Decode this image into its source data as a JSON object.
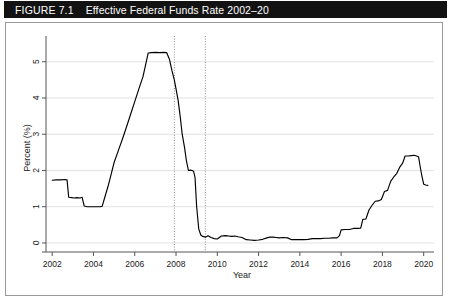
{
  "header": {
    "figure_label": "FIGURE 7.1",
    "title": "Effective Federal Funds Rate 2002–20",
    "bar_color": "#121212",
    "text_color": "#ffffff"
  },
  "chart_data": {
    "type": "line",
    "title": "Effective Federal Funds Rate 2002–20",
    "xlabel": "Year",
    "ylabel": "Percent (%)",
    "xlim": [
      2001.7,
      2020.5
    ],
    "ylim": [
      -0.25,
      5.6
    ],
    "grid": true,
    "legend": null,
    "line_color": "#000000",
    "grid_color": "#e2e2e2",
    "axis_color": "#555555",
    "xticks": [
      2002,
      2004,
      2006,
      2008,
      2010,
      2012,
      2014,
      2016,
      2018,
      2020
    ],
    "xtick_labels": [
      "2002",
      "2004",
      "2006",
      "2008",
      "2010",
      "2012",
      "2014",
      "2016",
      "2018",
      "2020"
    ],
    "yticks": [
      0,
      1,
      2,
      3,
      4,
      5
    ],
    "ytick_labels": [
      "0",
      "1",
      "2",
      "3",
      "4",
      "5"
    ],
    "annotations": [
      {
        "type": "vline",
        "name": "recession-start-marker",
        "x": 2007.92,
        "style": "dotted",
        "color": "#8c8c8c"
      },
      {
        "type": "vline",
        "name": "recession-end-marker",
        "x": 2009.42,
        "style": "dotted",
        "color": "#8c8c8c"
      }
    ],
    "series": [
      {
        "name": "Effective Federal Funds Rate",
        "x": [
          2002.0,
          2002.2,
          2002.4,
          2002.6,
          2002.72,
          2002.8,
          2002.95,
          2003.05,
          2003.2,
          2003.35,
          2003.45,
          2003.55,
          2003.7,
          2003.85,
          2004.0,
          2004.15,
          2004.3,
          2004.42,
          2004.55,
          2004.7,
          2004.85,
          2005.0,
          2005.2,
          2005.4,
          2005.6,
          2005.8,
          2006.0,
          2006.2,
          2006.4,
          2006.52,
          2006.65,
          2006.8,
          2007.0,
          2007.2,
          2007.4,
          2007.55,
          2007.68,
          2007.8,
          2007.92,
          2008.0,
          2008.1,
          2008.2,
          2008.3,
          2008.42,
          2008.5,
          2008.6,
          2008.7,
          2008.78,
          2008.85,
          2008.92,
          2009.0,
          2009.1,
          2009.2,
          2009.3,
          2009.42,
          2009.55,
          2009.7,
          2009.85,
          2010.0,
          2010.2,
          2010.4,
          2010.55,
          2010.7,
          2010.85,
          2011.0,
          2011.2,
          2011.4,
          2011.6,
          2011.8,
          2012.0,
          2012.2,
          2012.4,
          2012.55,
          2012.7,
          2012.85,
          2013.0,
          2013.2,
          2013.4,
          2013.6,
          2013.8,
          2014.0,
          2014.2,
          2014.4,
          2014.6,
          2014.8,
          2015.0,
          2015.2,
          2015.4,
          2015.6,
          2015.8,
          2015.92,
          2016.0,
          2016.2,
          2016.4,
          2016.6,
          2016.8,
          2016.95,
          2017.05,
          2017.2,
          2017.35,
          2017.5,
          2017.65,
          2017.8,
          2017.95,
          2018.1,
          2018.25,
          2018.4,
          2018.55,
          2018.7,
          2018.85,
          2018.98,
          2019.1,
          2019.25,
          2019.4,
          2019.55,
          2019.65,
          2019.75,
          2019.85,
          2019.92,
          2020.0,
          2020.1,
          2020.2
        ],
        "values": [
          1.73,
          1.74,
          1.74,
          1.75,
          1.74,
          1.26,
          1.25,
          1.24,
          1.25,
          1.24,
          1.26,
          1.02,
          1.0,
          1.0,
          1.0,
          1.0,
          1.0,
          1.01,
          1.26,
          1.55,
          1.88,
          2.22,
          2.54,
          2.86,
          3.2,
          3.55,
          3.9,
          4.25,
          4.59,
          4.9,
          5.24,
          5.25,
          5.26,
          5.25,
          5.26,
          5.25,
          5.07,
          4.76,
          4.49,
          4.25,
          3.94,
          3.5,
          3.0,
          2.61,
          2.28,
          2.0,
          2.01,
          2.0,
          1.98,
          1.81,
          1.0,
          0.39,
          0.22,
          0.18,
          0.16,
          0.2,
          0.15,
          0.12,
          0.11,
          0.19,
          0.2,
          0.19,
          0.18,
          0.19,
          0.17,
          0.15,
          0.09,
          0.08,
          0.07,
          0.08,
          0.1,
          0.14,
          0.16,
          0.16,
          0.15,
          0.14,
          0.15,
          0.14,
          0.09,
          0.09,
          0.09,
          0.09,
          0.1,
          0.12,
          0.12,
          0.12,
          0.13,
          0.13,
          0.14,
          0.14,
          0.2,
          0.36,
          0.37,
          0.37,
          0.4,
          0.4,
          0.41,
          0.65,
          0.66,
          0.91,
          1.04,
          1.15,
          1.16,
          1.2,
          1.42,
          1.45,
          1.7,
          1.82,
          1.92,
          2.1,
          2.2,
          2.4,
          2.4,
          2.41,
          2.42,
          2.4,
          2.38,
          2.04,
          1.83,
          1.62,
          1.6,
          1.59
        ]
      }
    ]
  }
}
